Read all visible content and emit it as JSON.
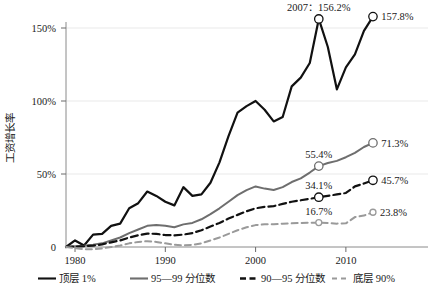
{
  "chart_data": {
    "type": "line",
    "title": "",
    "xlabel": "",
    "ylabel": "工资增长率",
    "xlim": [
      1979,
      2014
    ],
    "ylim": [
      0,
      160
    ],
    "grid": true,
    "legend_position": "bottom",
    "y_ticks": [
      "0",
      "50%",
      "100%",
      "150%"
    ],
    "y_tick_values": [
      0,
      50,
      100,
      150
    ],
    "x_ticks": [
      "1980",
      "1990",
      "2000",
      "2010"
    ],
    "x_tick_values": [
      1980,
      1990,
      2000,
      2010
    ],
    "annotations": [
      {
        "text": "2007：156.2%",
        "series": "顶层 1%",
        "x": 2007,
        "y": 156.2
      },
      {
        "text": "157.8%",
        "series": "顶层 1%",
        "x": 2013,
        "y": 157.8
      },
      {
        "text": "55.4%",
        "series": "95—99 分位数",
        "x": 2007,
        "y": 55.4
      },
      {
        "text": "71.3%",
        "series": "95—99 分位数",
        "x": 2013,
        "y": 71.3
      },
      {
        "text": "34.1%",
        "series": "90—95 分位数",
        "x": 2007,
        "y": 34.1
      },
      {
        "text": "45.7%",
        "series": "90—95 分位数",
        "x": 2013,
        "y": 45.7
      },
      {
        "text": "16.7%",
        "series": "底层 90%",
        "x": 2007,
        "y": 16.7
      },
      {
        "text": "23.8%",
        "series": "底层 90%",
        "x": 2013,
        "y": 23.8
      }
    ],
    "x": [
      1979,
      1980,
      1981,
      1982,
      1983,
      1984,
      1985,
      1986,
      1987,
      1988,
      1989,
      1990,
      1991,
      1992,
      1993,
      1994,
      1995,
      1996,
      1997,
      1998,
      1999,
      2000,
      2001,
      2002,
      2003,
      2004,
      2005,
      2006,
      2007,
      2008,
      2009,
      2010,
      2011,
      2012,
      2013
    ],
    "series": [
      {
        "name": "顶层 1%",
        "color": "#111111",
        "dash": "none",
        "width": 2.2,
        "values": [
          0,
          4.5,
          1.0,
          8.5,
          9.0,
          14.5,
          16.0,
          26.5,
          30.0,
          38.0,
          35.0,
          31.0,
          28.5,
          41.0,
          35.0,
          36.0,
          44.0,
          58.0,
          76.0,
          92.0,
          96.5,
          100.0,
          94.0,
          86.0,
          89.0,
          110.0,
          116.0,
          126.0,
          156.2,
          137.0,
          108.0,
          123.0,
          132.0,
          148.0,
          157.8
        ]
      },
      {
        "name": "95—99 分位数",
        "color": "#6e6e6e",
        "dash": "none",
        "width": 2.0,
        "values": [
          0,
          0.5,
          0.8,
          1.5,
          2.5,
          4.5,
          6.5,
          9.5,
          12.0,
          14.5,
          15.0,
          14.5,
          13.5,
          15.5,
          16.5,
          19.0,
          22.5,
          26.5,
          31.0,
          35.5,
          39.0,
          41.5,
          40.0,
          39.0,
          41.0,
          44.5,
          47.0,
          51.0,
          55.4,
          57.5,
          59.0,
          61.5,
          64.5,
          68.5,
          71.3
        ]
      },
      {
        "name": "90—95 分位数",
        "color": "#111111",
        "dash": "7,4",
        "width": 2.2,
        "values": [
          0,
          0.3,
          0.5,
          1.0,
          1.8,
          3.2,
          4.5,
          6.5,
          8.0,
          9.2,
          9.0,
          8.2,
          8.0,
          8.5,
          9.5,
          11.5,
          14.0,
          16.5,
          19.5,
          22.0,
          24.5,
          26.5,
          27.5,
          28.0,
          29.5,
          31.0,
          32.0,
          33.0,
          34.1,
          35.0,
          36.0,
          37.0,
          41.5,
          43.5,
          45.7
        ]
      },
      {
        "name": "底层 90%",
        "color": "#9a9a9a",
        "dash": "6,4",
        "width": 2.0,
        "values": [
          0,
          -0.8,
          -1.5,
          -1.5,
          -1.0,
          0.0,
          1.0,
          2.5,
          3.5,
          4.0,
          3.5,
          2.5,
          1.5,
          1.2,
          1.5,
          2.5,
          4.5,
          6.5,
          9.0,
          11.5,
          13.5,
          15.0,
          15.5,
          15.5,
          16.0,
          16.2,
          16.5,
          16.6,
          16.7,
          16.5,
          16.0,
          16.2,
          20.5,
          21.5,
          23.8
        ]
      }
    ]
  },
  "legend": {
    "items": [
      {
        "label": "顶层 1%",
        "color": "#111111",
        "dash": "none"
      },
      {
        "label": "95—99 分位数",
        "color": "#6e6e6e",
        "dash": "none"
      },
      {
        "label": "90—95 分位数",
        "color": "#111111",
        "dash": "dashed"
      },
      {
        "label": "底层 90%",
        "color": "#9a9a9a",
        "dash": "dashed"
      }
    ]
  }
}
